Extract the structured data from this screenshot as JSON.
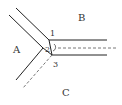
{
  "diagram": {
    "regions": [
      {
        "id": "A",
        "label": "A"
      },
      {
        "id": "B",
        "label": "B"
      },
      {
        "id": "C",
        "label": "C"
      }
    ],
    "points": [
      {
        "id": "1",
        "label": "1"
      },
      {
        "id": "2",
        "label": "2"
      },
      {
        "id": "3",
        "label": "3"
      }
    ],
    "colors": {
      "line": "#222222",
      "dashed": "#555555",
      "text": "#333333",
      "background": "#ffffff"
    }
  }
}
